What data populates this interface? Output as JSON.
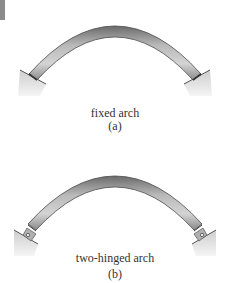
{
  "figures": [
    {
      "id": "a",
      "caption": "fixed arch",
      "label": "(a)",
      "support_type": "fixed",
      "support_icon": "fixed-support-icon"
    },
    {
      "id": "b",
      "caption": "two-hinged arch",
      "label": "(b)",
      "support_type": "pinned",
      "support_icon": "hinge-pin-icon"
    }
  ],
  "colors": {
    "arch_dark": "#5a5a5a",
    "arch_mid": "#9a9a9a",
    "arch_light": "#d0d0d0",
    "support_fill": "#d9d9d9",
    "corner_block": "#8a8a8a",
    "text": "#333333"
  }
}
